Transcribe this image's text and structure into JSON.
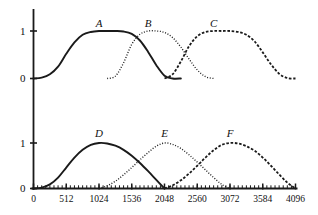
{
  "figure": {
    "title": "",
    "background_color": "#ffffff",
    "line_color": "#1a1a1a"
  },
  "chart_data": {
    "type": "line",
    "title": "",
    "xlabel": "",
    "ylabel": "",
    "grid": false,
    "legend_position": "inline-labels",
    "panels": [
      {
        "name": "top-panel",
        "ylim": [
          0,
          1
        ],
        "xlim": [
          0,
          4096
        ],
        "ytick_labels": [
          "1",
          "0"
        ],
        "ytick_values": [
          1,
          0
        ],
        "series": [
          {
            "name": "A",
            "label": "A",
            "style": "solid",
            "label_x": 1024,
            "label_y": 1.15,
            "points": [
              [
                0,
                0.0
              ],
              [
                128,
                0.02
              ],
              [
                256,
                0.09
              ],
              [
                384,
                0.25
              ],
              [
                512,
                0.52
              ],
              [
                640,
                0.76
              ],
              [
                768,
                0.92
              ],
              [
                896,
                0.98
              ],
              [
                1024,
                1.0
              ],
              [
                1152,
                1.0
              ],
              [
                1280,
                1.0
              ],
              [
                1408,
                0.99
              ],
              [
                1536,
                0.94
              ],
              [
                1664,
                0.8
              ],
              [
                1792,
                0.56
              ],
              [
                1920,
                0.28
              ],
              [
                2048,
                0.06
              ],
              [
                2176,
                0.0
              ],
              [
                2304,
                0.0
              ]
            ]
          },
          {
            "name": "B",
            "label": "B",
            "style": "dotted",
            "label_x": 1792,
            "label_y": 1.15,
            "points": [
              [
                1152,
                0.0
              ],
              [
                1280,
                0.05
              ],
              [
                1408,
                0.33
              ],
              [
                1536,
                0.72
              ],
              [
                1664,
                0.93
              ],
              [
                1792,
                1.0
              ],
              [
                1920,
                1.0
              ],
              [
                2048,
                0.97
              ],
              [
                2176,
                0.86
              ],
              [
                2304,
                0.66
              ],
              [
                2432,
                0.41
              ],
              [
                2560,
                0.18
              ],
              [
                2688,
                0.04
              ],
              [
                2816,
                0.0
              ]
            ]
          },
          {
            "name": "C",
            "label": "C",
            "style": "dashed",
            "label_x": 2816,
            "label_y": 1.15,
            "points": [
              [
                2048,
                0.0
              ],
              [
                2176,
                0.09
              ],
              [
                2304,
                0.36
              ],
              [
                2432,
                0.68
              ],
              [
                2560,
                0.89
              ],
              [
                2688,
                0.98
              ],
              [
                2816,
                1.0
              ],
              [
                2944,
                1.0
              ],
              [
                3072,
                1.0
              ],
              [
                3200,
                0.98
              ],
              [
                3328,
                0.92
              ],
              [
                3456,
                0.78
              ],
              [
                3584,
                0.55
              ],
              [
                3712,
                0.3
              ],
              [
                3840,
                0.1
              ],
              [
                3968,
                0.01
              ],
              [
                4096,
                0.0
              ]
            ]
          }
        ]
      },
      {
        "name": "bottom-panel",
        "ylim": [
          0,
          1
        ],
        "xlim": [
          0,
          4096
        ],
        "ytick_labels": [
          "1",
          "0"
        ],
        "ytick_values": [
          1,
          0
        ],
        "xtick_labels": [
          "0",
          "512",
          "1024",
          "1536",
          "2048",
          "2560",
          "3072",
          "3584",
          "4096"
        ],
        "xtick_values": [
          0,
          512,
          1024,
          1536,
          2048,
          2560,
          3072,
          3584,
          4096
        ],
        "minor_tick_step": 64,
        "series": [
          {
            "name": "D",
            "label": "D",
            "style": "solid",
            "label_x": 1024,
            "label_y": 1.2,
            "points": [
              [
                0,
                0.0
              ],
              [
                128,
                0.02
              ],
              [
                256,
                0.09
              ],
              [
                384,
                0.24
              ],
              [
                512,
                0.46
              ],
              [
                640,
                0.68
              ],
              [
                768,
                0.85
              ],
              [
                896,
                0.96
              ],
              [
                1024,
                1.0
              ],
              [
                1152,
                0.99
              ],
              [
                1280,
                0.94
              ],
              [
                1408,
                0.85
              ],
              [
                1536,
                0.72
              ],
              [
                1664,
                0.56
              ],
              [
                1792,
                0.38
              ],
              [
                1920,
                0.19
              ],
              [
                2048,
                0.0
              ]
            ]
          },
          {
            "name": "E",
            "label": "E",
            "style": "dotted",
            "label_x": 2048,
            "label_y": 1.2,
            "points": [
              [
                1024,
                0.0
              ],
              [
                1152,
                0.06
              ],
              [
                1280,
                0.16
              ],
              [
                1408,
                0.3
              ],
              [
                1536,
                0.46
              ],
              [
                1664,
                0.63
              ],
              [
                1792,
                0.79
              ],
              [
                1920,
                0.93
              ],
              [
                2048,
                1.0
              ],
              [
                2176,
                0.97
              ],
              [
                2304,
                0.88
              ],
              [
                2432,
                0.74
              ],
              [
                2560,
                0.58
              ],
              [
                2688,
                0.41
              ],
              [
                2816,
                0.24
              ],
              [
                2944,
                0.09
              ],
              [
                3072,
                0.0
              ]
            ]
          },
          {
            "name": "F",
            "label": "F",
            "style": "dashed",
            "label_x": 3072,
            "label_y": 1.2,
            "points": [
              [
                2048,
                0.0
              ],
              [
                2176,
                0.07
              ],
              [
                2304,
                0.18
              ],
              [
                2432,
                0.33
              ],
              [
                2560,
                0.5
              ],
              [
                2688,
                0.68
              ],
              [
                2816,
                0.84
              ],
              [
                2944,
                0.96
              ],
              [
                3072,
                1.0
              ],
              [
                3200,
                0.99
              ],
              [
                3328,
                0.93
              ],
              [
                3456,
                0.83
              ],
              [
                3584,
                0.68
              ],
              [
                3712,
                0.5
              ],
              [
                3840,
                0.31
              ],
              [
                3968,
                0.13
              ],
              [
                4096,
                0.0
              ]
            ]
          }
        ]
      }
    ]
  }
}
